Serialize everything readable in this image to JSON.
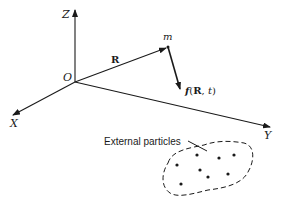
{
  "diagram": {
    "axes": {
      "z_label": "Z",
      "x_label": "X",
      "y_label": "Y",
      "origin_label": "O"
    },
    "vectors": {
      "position_label": "R",
      "particle_label": "m",
      "force_label_f": "f",
      "force_label_args_open": "(",
      "force_label_R": "R",
      "force_label_sep": ", ",
      "force_label_t": "t",
      "force_label_args_close": ")"
    },
    "region": {
      "label": "External particles",
      "particle_count": 8
    },
    "colors": {
      "ink": "#1a1a1a",
      "background": "#ffffff"
    }
  }
}
